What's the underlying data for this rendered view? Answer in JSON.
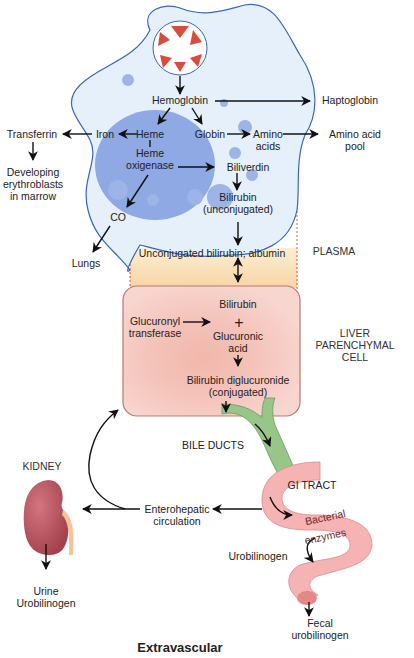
{
  "diagram": {
    "title": "Extravascular",
    "colors": {
      "macrophage_fill": "#e3effa",
      "macrophage_stroke": "#3a67b8",
      "nucleus": "#8ea9e3",
      "plasma_band": "#f9dcae",
      "liver_fill": "#f5c9c2",
      "liver_stroke": "#b77a6f",
      "bile_duct": "#98c689",
      "gi_tract": "#f6b3b3",
      "kidney": "#b5525d",
      "rbc": "#d94b3a"
    },
    "nodes": {
      "rbc": "RBC",
      "hemoglobin": "Hemoglobin",
      "haptoglobin": "Haptoglobin",
      "transferrin": "Transferrin",
      "iron": "Iron",
      "heme": "Heme",
      "globin": "Globin",
      "amino_acids_1": "Amino",
      "amino_acids_2": "acids",
      "amino_pool_1": "Amino acid",
      "amino_pool_2": "pool",
      "heme_oxigenase_1": "Heme",
      "heme_oxigenase_2": "oxigenase",
      "developing_1": "Developing",
      "developing_2": "erythroblasts",
      "developing_3": "in marrow",
      "biliverdin": "Biliverdin",
      "bilirubin_unconj_1": "Bilirubin",
      "bilirubin_unconj_2": "(unconjugated)",
      "co": "CO",
      "lungs": "Lungs",
      "plasma_text": "Unconjugated bilirubin; albumin",
      "plasma_label": "PLASMA",
      "liver_bilirubin": "Bilirubin",
      "plus": "+",
      "glucuronyl_1": "Glucuronyl",
      "glucuronyl_2": "transferase",
      "glucuronic_1": "Glucuronic",
      "glucuronic_2": "acid",
      "liver_label_1": "LIVER",
      "liver_label_2": "PARENCHYMAL",
      "liver_label_3": "CELL",
      "diglucuronide_1": "Bilirubin diglucuronide",
      "diglucuronide_2": "(conjugated)",
      "bile_ducts": "BILE DUCTS",
      "gi_tract": "GI TRACT",
      "kidney": "KIDNEY",
      "enterohepatic_1": "Enterohepatic",
      "enterohepatic_2": "circulation",
      "bacterial": "Bacterial",
      "enzymes": "enzymes",
      "urobilinogen": "Urobilinogen",
      "urine_1": "Urine",
      "urine_2": "Urobilinogen",
      "fecal_1": "Fecal",
      "fecal_2": "urobilinogen"
    }
  }
}
